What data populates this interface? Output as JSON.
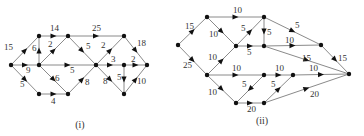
{
  "diagrams": [
    {
      "caption": "(i)",
      "caption_pos": [
        80,
        128
      ],
      "nodes": {
        "L": [
          11,
          65
        ],
        "TL": [
          39,
          36
        ],
        "TM": [
          68,
          36
        ],
        "TR": [
          124,
          36
        ],
        "ML": [
          39,
          65
        ],
        "C": [
          96,
          65
        ],
        "MR": [
          124,
          65
        ],
        "R": [
          147,
          65
        ],
        "BL": [
          39,
          94
        ],
        "BM": [
          68,
          94
        ],
        "BR": [
          124,
          94
        ]
      },
      "edges": [
        {
          "from": "L",
          "to": "TL",
          "label": "15",
          "lx": 4,
          "ly": 50
        },
        {
          "from": "TL",
          "to": "TM",
          "label": "14",
          "lx": 50,
          "ly": 31
        },
        {
          "from": "TM",
          "to": "TR",
          "label": "25",
          "lx": 92,
          "ly": 31
        },
        {
          "from": "TR",
          "to": "R",
          "label": "18",
          "lx": 137,
          "ly": 46
        },
        {
          "from": "ML",
          "to": "TL",
          "label": "6",
          "lx": 32,
          "ly": 51
        },
        {
          "from": "ML",
          "to": "TM",
          "label": "2",
          "lx": 48,
          "ly": 47
        },
        {
          "from": "TM",
          "to": "C",
          "label": "5",
          "lx": 86,
          "ly": 49
        },
        {
          "from": "L",
          "to": "ML",
          "label": "9",
          "lx": 26,
          "ly": 73
        },
        {
          "from": "ML",
          "to": "C",
          "label": "5",
          "lx": 70,
          "ly": 73
        },
        {
          "from": "L",
          "to": "BL",
          "label": "5",
          "lx": 20,
          "ly": 87
        },
        {
          "from": "BL",
          "to": "BM",
          "label": "4",
          "lx": 51,
          "ly": 104
        },
        {
          "from": "ML",
          "to": "BM",
          "label": "6",
          "lx": 55,
          "ly": 81
        },
        {
          "from": "BM",
          "to": "C",
          "label": "8",
          "lx": 85,
          "ly": 85
        },
        {
          "from": "C",
          "to": "TR",
          "label": "2",
          "lx": 101,
          "ly": 48
        },
        {
          "from": "C",
          "to": "MR",
          "label": "3",
          "lx": 111,
          "ly": 62
        },
        {
          "from": "MR",
          "to": "R",
          "label": "2",
          "lx": 131,
          "ly": 62
        },
        {
          "from": "MR",
          "to": "BR",
          "label": "5",
          "lx": 117,
          "ly": 80
        },
        {
          "from": "C",
          "to": "BR",
          "label": "8",
          "lx": 103,
          "ly": 84
        },
        {
          "from": "BR",
          "to": "R",
          "label": "10",
          "lx": 137,
          "ly": 84
        }
      ]
    },
    {
      "caption": "(ii)",
      "caption_pos": [
        262,
        124
      ],
      "nodes": {
        "L": [
          178,
          45
        ],
        "TL": [
          207,
          17
        ],
        "TM": [
          264,
          17
        ],
        "MU": [
          236,
          46
        ],
        "MUR": [
          264,
          46
        ],
        "RU": [
          321,
          45
        ],
        "ML": [
          207,
          75
        ],
        "MM1": [
          264,
          75
        ],
        "MM2": [
          293,
          75
        ],
        "S": [
          349,
          74
        ],
        "B1": [
          236,
          103
        ],
        "B2": [
          264,
          103
        ]
      },
      "edges": [
        {
          "from": "L",
          "to": "TL",
          "label": "15",
          "lx": 185,
          "ly": 29
        },
        {
          "from": "L",
          "to": "ML",
          "label": "25",
          "lx": 183,
          "ly": 68
        },
        {
          "from": "TL",
          "to": "TM",
          "label": "10",
          "lx": 233,
          "ly": 13
        },
        {
          "from": "TL",
          "to": "MU",
          "label": "10",
          "lx": 209,
          "ly": 37
        },
        {
          "from": "MU",
          "to": "TM",
          "label": "5",
          "lx": 241,
          "ly": 31
        },
        {
          "from": "TM",
          "to": "MUR",
          "label": "5",
          "lx": 267,
          "ly": 35
        },
        {
          "from": "MU",
          "to": "MUR",
          "label": "5",
          "lx": 247,
          "ly": 55
        },
        {
          "from": "TM",
          "to": "RU",
          "label": "5",
          "lx": 295,
          "ly": 28
        },
        {
          "from": "MUR",
          "to": "RU",
          "label": "10",
          "lx": 285,
          "ly": 43
        },
        {
          "from": "MUR",
          "to": "S",
          "label": "15",
          "lx": 302,
          "ly": 61
        },
        {
          "from": "RU",
          "to": "S",
          "label": "15",
          "lx": 338,
          "ly": 61
        },
        {
          "from": "ML",
          "to": "MU",
          "label": "10",
          "lx": 208,
          "ly": 60
        },
        {
          "from": "ML",
          "to": "MM1",
          "label": "10",
          "lx": 232,
          "ly": 71
        },
        {
          "from": "MM1",
          "to": "MM2",
          "label": "10",
          "lx": 275,
          "ly": 71
        },
        {
          "from": "MM2",
          "to": "S",
          "label": "10",
          "lx": 309,
          "ly": 71
        },
        {
          "from": "ML",
          "to": "B1",
          "label": "10",
          "lx": 208,
          "ly": 95
        },
        {
          "from": "MM1",
          "to": "B1",
          "label": "5",
          "lx": 242,
          "ly": 87
        },
        {
          "from": "B1",
          "to": "B2",
          "label": "20",
          "lx": 247,
          "ly": 112
        },
        {
          "from": "B2",
          "to": "MM2",
          "label": "5",
          "lx": 271,
          "ly": 87
        },
        {
          "from": "B2",
          "to": "S",
          "label": "20",
          "lx": 310,
          "ly": 97
        }
      ]
    }
  ]
}
